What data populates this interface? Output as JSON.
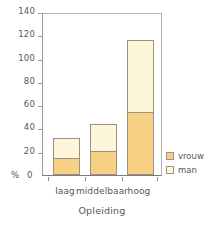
{
  "chart_data": {
    "type": "bar",
    "subtype": "stacked",
    "title": "",
    "xlabel": "Opleiding",
    "ylabel": "%",
    "categories": [
      "laag",
      "middelbaar",
      "hoog"
    ],
    "series": [
      {
        "name": "vrouw",
        "color": "#f7d083",
        "values": [
          15,
          21,
          54
        ]
      },
      {
        "name": "man",
        "color": "#fdf6d8",
        "values": [
          17,
          23,
          62
        ]
      }
    ],
    "totals": [
      32,
      44,
      116
    ],
    "ylim": [
      0,
      140
    ],
    "yticks": [
      0,
      20,
      40,
      60,
      80,
      100,
      120,
      140
    ],
    "ytick_labels": [
      "0",
      "20",
      "40",
      "60",
      "80",
      "100",
      "120",
      "140"
    ],
    "grid": false,
    "legend_position": "right-bottom"
  },
  "axis": {
    "y_unit_label": "%",
    "x_title": "Opleiding"
  },
  "legend": {
    "items": [
      {
        "label": "vrouw",
        "color": "#f7d083"
      },
      {
        "label": "man",
        "color": "#fdf6d8"
      }
    ]
  },
  "colors": {
    "vrouw": "#f7d083",
    "man": "#fdf6d8",
    "bar_border": "#9b9186",
    "axis": "#9a9a9a",
    "text": "#5d554f",
    "background": "#ffffff"
  }
}
